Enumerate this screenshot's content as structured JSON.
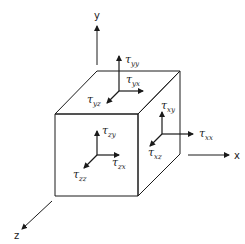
{
  "colors": {
    "line": "#1a1a1a",
    "background": "#ffffff"
  },
  "axes": {
    "x": "x",
    "y": "y",
    "z": "z"
  },
  "stress_labels": {
    "top_face": {
      "normal": {
        "sym": "τ",
        "sub": "yy"
      },
      "shear1": {
        "sym": "τ",
        "sub": "yx"
      },
      "shear2": {
        "sym": "τ",
        "sub": "yz"
      }
    },
    "right_face": {
      "normal": {
        "sym": "τ",
        "sub": "xx"
      },
      "shear1": {
        "sym": "τ",
        "sub": "xy"
      },
      "shear2": {
        "sym": "τ",
        "sub": "xz"
      }
    },
    "front_face": {
      "normal": {
        "sym": "τ",
        "sub": "zz"
      },
      "shear1": {
        "sym": "τ",
        "sub": "zy"
      },
      "shear2": {
        "sym": "τ",
        "sub": "zx"
      }
    }
  }
}
